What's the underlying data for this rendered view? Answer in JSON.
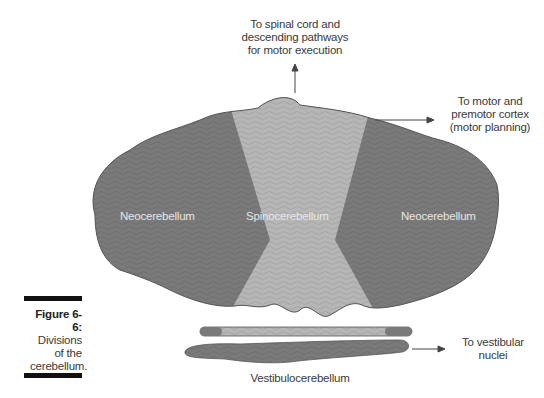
{
  "figure": {
    "number": "Figure 6-6:",
    "caption_lines": [
      "Divisions",
      "of the",
      "cerebellum."
    ]
  },
  "regions": {
    "left": "Neocerebellum",
    "center": "Spinocerebellum",
    "right": "Neocerebellum",
    "bottom": "Vestibulocerebellum"
  },
  "annotations": {
    "top": [
      "To spinal cord and",
      "descending pathways",
      "for motor execution"
    ],
    "right": [
      "To motor and",
      "premotor cortex",
      "(motor planning)"
    ],
    "bottom_right": [
      "To vestibular",
      "nuclei"
    ]
  },
  "colors": {
    "neocerebellum": "#7a7a7a",
    "spinocerebellum": "#b4b4b4",
    "vestibulocerebellum": "#7e7e7e",
    "outline": "#555555",
    "text": "#3a3a3a"
  }
}
